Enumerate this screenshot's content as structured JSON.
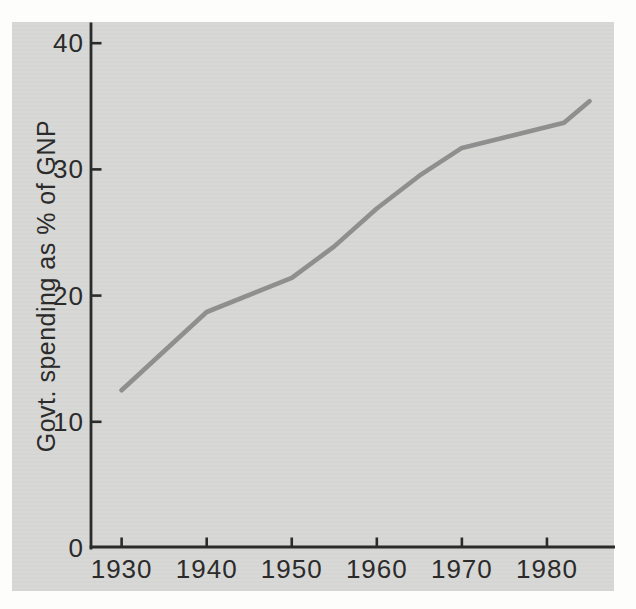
{
  "figure": {
    "background_color": "#fdfdfb",
    "panel_color": "#d8d8d6",
    "axis_color": "#2b2b2b",
    "text_color": "#2b2b2b",
    "line_color": "#8f8f8f"
  },
  "chart_data": {
    "type": "line",
    "title": "",
    "xlabel": "",
    "ylabel": "Govt. spending as % of GNP",
    "x_ticks": [
      "1930",
      "1940",
      "1950",
      "1960",
      "1970",
      "1980"
    ],
    "y_ticks": [
      "40",
      "30",
      "20",
      "10",
      "0"
    ],
    "xlim": [
      1926.4,
      1988
    ],
    "ylim": [
      0,
      41.6
    ],
    "grid": false,
    "legend_position": "none",
    "series": [
      {
        "name": "Govt. spending as % of GNP",
        "x": [
          1930,
          1940,
          1950,
          1955,
          1960,
          1965,
          1970,
          1982,
          1985
        ],
        "values": [
          12.5,
          18.7,
          21.4,
          23.9,
          26.9,
          29.5,
          31.7,
          33.7,
          35.4
        ]
      }
    ]
  }
}
